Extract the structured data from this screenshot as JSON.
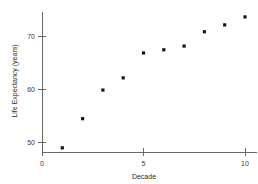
{
  "chart_data": {
    "type": "scatter",
    "title": "",
    "xlabel": "Decade",
    "ylabel": "Life Expectancy (years)",
    "xlim": [
      0,
      10.6
    ],
    "ylim": [
      47.8,
      75.8
    ],
    "grid": false,
    "legend": null,
    "xticks": [
      {
        "value": 0,
        "label": "0"
      },
      {
        "value": 5,
        "label": "5"
      },
      {
        "value": 10,
        "label": "10"
      }
    ],
    "yticks": [
      {
        "value": 50,
        "label": "50"
      },
      {
        "value": 60,
        "label": "60"
      },
      {
        "value": 70,
        "label": "70"
      }
    ],
    "series": [
      {
        "name": "Life Expectancy",
        "marker": "filled-square",
        "color": "#151515",
        "x": [
          1,
          2,
          3,
          4,
          5,
          6,
          7,
          8,
          9,
          10
        ],
        "y": [
          48.9,
          54.4,
          59.8,
          62.1,
          66.8,
          67.4,
          68.1,
          70.8,
          72.1,
          73.6
        ]
      }
    ]
  },
  "axes": {
    "x_title": "Decade",
    "y_title": "Life Expectancy (years)"
  }
}
